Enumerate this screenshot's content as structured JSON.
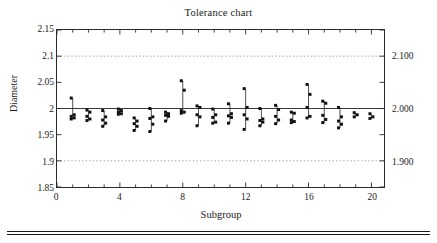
{
  "chart_data": {
    "type": "scatter",
    "title": "Tolerance chart",
    "xlabel": "Subgroup",
    "ylabel": "Diameter",
    "xlim": [
      0,
      20.8
    ],
    "ylim": [
      1.85,
      2.15
    ],
    "xticks": [
      0,
      4,
      8,
      12,
      16,
      20
    ],
    "xtick_labels": [
      "0",
      "4",
      "8",
      "12",
      "16",
      "20"
    ],
    "yticks": [
      1.85,
      1.9,
      1.95,
      2.0,
      2.05,
      2.1,
      2.15
    ],
    "ytick_labels": [
      "1.85",
      "1.9",
      "1.95",
      "2",
      "2.05",
      "2.1",
      "2.15"
    ],
    "secondary_yticks": [
      1.9,
      2.0,
      2.1
    ],
    "secondary_ytick_labels": [
      "1.900",
      "2.000",
      "2.100"
    ],
    "grid": false,
    "legend": "none",
    "center_line": 2.0,
    "spec_limits": [
      1.9,
      2.1
    ],
    "spec_line_style": "dotted",
    "marker": "square",
    "marker_color": "#111111",
    "connector": "vertical-range-line",
    "series": [
      {
        "name": "Subgroup 1",
        "x": 1,
        "values": [
          2.02,
          1.988,
          1.985,
          1.982,
          1.98
        ]
      },
      {
        "name": "Subgroup 2",
        "x": 2,
        "values": [
          1.997,
          1.993,
          1.985,
          1.98,
          1.977
        ]
      },
      {
        "name": "Subgroup 3",
        "x": 3,
        "values": [
          1.996,
          1.984,
          1.978,
          1.972,
          1.966
        ]
      },
      {
        "name": "Subgroup 4",
        "x": 4,
        "values": [
          1.999,
          1.996,
          1.993,
          1.99,
          1.989
        ]
      },
      {
        "name": "Subgroup 5",
        "x": 5,
        "values": [
          1.982,
          1.976,
          1.971,
          1.966,
          1.958
        ]
      },
      {
        "name": "Subgroup 6",
        "x": 6,
        "values": [
          2.0,
          1.984,
          1.981,
          1.97,
          1.956
        ]
      },
      {
        "name": "Subgroup 7",
        "x": 7,
        "values": [
          1.993,
          1.99,
          1.987,
          1.985,
          1.976
        ]
      },
      {
        "name": "Subgroup 8",
        "x": 8,
        "values": [
          2.053,
          2.035,
          1.996,
          1.993,
          1.991
        ]
      },
      {
        "name": "Subgroup 9",
        "x": 9,
        "values": [
          2.005,
          2.002,
          1.988,
          1.984,
          1.967
        ]
      },
      {
        "name": "Subgroup 10",
        "x": 10,
        "values": [
          1.999,
          1.988,
          1.983,
          1.974,
          1.972
        ]
      },
      {
        "name": "Subgroup 11",
        "x": 11,
        "values": [
          2.009,
          1.99,
          1.986,
          1.983,
          1.972
        ]
      },
      {
        "name": "Subgroup 12",
        "x": 12,
        "values": [
          2.038,
          2.002,
          1.988,
          1.98,
          1.96
        ]
      },
      {
        "name": "Subgroup 13",
        "x": 13,
        "values": [
          2.0,
          1.98,
          1.977,
          1.974,
          1.967
        ]
      },
      {
        "name": "Subgroup 14",
        "x": 14,
        "values": [
          2.006,
          1.998,
          1.985,
          1.978,
          1.971
        ]
      },
      {
        "name": "Subgroup 15",
        "x": 15,
        "values": [
          1.993,
          1.991,
          1.978,
          1.975,
          1.973
        ]
      },
      {
        "name": "Subgroup 16",
        "x": 16,
        "values": [
          2.046,
          2.027,
          2.002,
          1.985,
          1.982
        ]
      },
      {
        "name": "Subgroup 17",
        "x": 17,
        "values": [
          2.014,
          2.01,
          1.987,
          1.979,
          1.973
        ]
      },
      {
        "name": "Subgroup 18",
        "x": 18,
        "values": [
          2.002,
          1.984,
          1.976,
          1.97,
          1.963
        ]
      },
      {
        "name": "Subgroup 19",
        "x": 19,
        "values": [
          1.992,
          1.988,
          1.984
        ]
      },
      {
        "name": "Subgroup 20",
        "x": 20,
        "values": [
          1.99,
          1.984,
          1.981
        ]
      }
    ]
  }
}
